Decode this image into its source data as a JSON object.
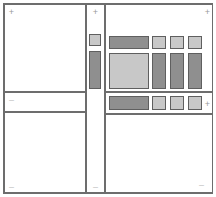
{
  "window": {
    "title": "Pane Layout Wireframe",
    "width": 216,
    "height": 197
  },
  "colors": {
    "frame_border": "#6d6d6d",
    "pane_border": "#6d6d6d",
    "block_border": "#5f5f5f",
    "block_dark": "#8f8f8f",
    "block_mid": "#a6a6a6",
    "block_light": "#c8c8c8",
    "handle": "#9a9a9a",
    "handle_faint": "#c2c2c2",
    "background": "#ffffff"
  },
  "handles": {
    "expand_symbol": "+",
    "collapse_symbol": "–",
    "items": [
      {
        "name": "top-left-expand",
        "symbol": "+",
        "faint": false,
        "x": 7,
        "y": 8
      },
      {
        "name": "middle-column-top-expand",
        "symbol": "+",
        "faint": false,
        "x": 91,
        "y": 8
      },
      {
        "name": "top-right-expand",
        "symbol": "+",
        "faint": false,
        "x": 203,
        "y": 8
      },
      {
        "name": "left-middle-collapse",
        "symbol": "–",
        "faint": true,
        "x": 7,
        "y": 96
      },
      {
        "name": "right-strip-expand",
        "symbol": "+",
        "faint": false,
        "x": 203,
        "y": 100
      },
      {
        "name": "bottom-left-collapse",
        "symbol": "–",
        "faint": true,
        "x": 7,
        "y": 183
      },
      {
        "name": "middle-column-bottom-collapse",
        "symbol": "–",
        "faint": true,
        "x": 91,
        "y": 183
      },
      {
        "name": "bottom-right-collapse",
        "symbol": "–",
        "faint": true,
        "x": 197,
        "y": 181
      }
    ]
  },
  "panes": {
    "top_left": {
      "label": "",
      "x": 4,
      "y": 4,
      "w": 82,
      "h": 88
    },
    "middle_column": {
      "label": "",
      "x": 86,
      "y": 4,
      "w": 19,
      "h": 189
    },
    "top_right": {
      "label": "",
      "x": 105,
      "y": 4,
      "w": 108,
      "h": 88
    },
    "left_strip": {
      "label": "",
      "x": 4,
      "y": 92,
      "w": 82,
      "h": 20
    },
    "right_strip": {
      "label": "",
      "x": 105,
      "y": 92,
      "w": 108,
      "h": 22
    },
    "bottom_left": {
      "label": "",
      "x": 4,
      "y": 112,
      "w": 82,
      "h": 81
    },
    "bottom_right": {
      "label": "",
      "x": 105,
      "y": 114,
      "w": 108,
      "h": 79
    }
  },
  "blocks": {
    "middle_column": [
      {
        "name": "mid-col-small-square",
        "tone": "light",
        "x": 89,
        "y": 34,
        "w": 12,
        "h": 12
      },
      {
        "name": "mid-col-tall-bar",
        "tone": "dark",
        "x": 89,
        "y": 51,
        "w": 12,
        "h": 38
      }
    ],
    "top_right_row_top": [
      {
        "name": "wide-dark-bar",
        "tone": "dark",
        "x": 109,
        "y": 36,
        "w": 40,
        "h": 13
      },
      {
        "name": "small-square-1",
        "tone": "light",
        "x": 152,
        "y": 36,
        "w": 14,
        "h": 13
      },
      {
        "name": "small-square-2",
        "tone": "light",
        "x": 170,
        "y": 36,
        "w": 14,
        "h": 13
      },
      {
        "name": "small-square-3",
        "tone": "light",
        "x": 188,
        "y": 36,
        "w": 14,
        "h": 13
      }
    ],
    "top_right_row_bottom": [
      {
        "name": "large-light-panel",
        "tone": "light",
        "x": 109,
        "y": 53,
        "w": 40,
        "h": 36
      },
      {
        "name": "tall-bar-1",
        "tone": "dark",
        "x": 152,
        "y": 53,
        "w": 14,
        "h": 36
      },
      {
        "name": "tall-bar-2",
        "tone": "dark",
        "x": 170,
        "y": 53,
        "w": 14,
        "h": 36
      },
      {
        "name": "tall-bar-3",
        "tone": "dark",
        "x": 188,
        "y": 53,
        "w": 14,
        "h": 36
      }
    ],
    "right_strip": [
      {
        "name": "strip-wide-bar",
        "tone": "dark",
        "x": 109,
        "y": 96,
        "w": 40,
        "h": 14
      },
      {
        "name": "strip-small-sq-1",
        "tone": "light",
        "x": 152,
        "y": 96,
        "w": 14,
        "h": 14
      },
      {
        "name": "strip-small-sq-2",
        "tone": "light",
        "x": 170,
        "y": 96,
        "w": 14,
        "h": 14
      },
      {
        "name": "strip-small-sq-3",
        "tone": "light",
        "x": 188,
        "y": 96,
        "w": 14,
        "h": 14
      }
    ]
  }
}
